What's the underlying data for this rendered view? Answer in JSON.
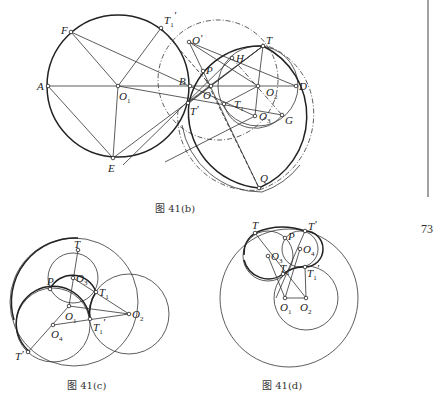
{
  "page_number": "73",
  "figures": [
    {
      "id": "fig-41b",
      "caption": "图 41(b)",
      "points": {
        "A": "A",
        "F": "F",
        "T1p": "T",
        "E": "E",
        "O1": "O",
        "B": "B",
        "Op": "O",
        "P": "P",
        "O": "O",
        "Tp": "T",
        "H": "H",
        "T": "T",
        "O2": "O",
        "D": "D",
        "T1": "T",
        "O3": "O",
        "G": "G",
        "Q": "Q"
      },
      "subscripts": {
        "T1p": "1",
        "O1": "1",
        "O2": "2",
        "T1": "1",
        "O3": "3"
      },
      "primes": {
        "T1p": "′",
        "Op": "′",
        "Tp": "′"
      }
    },
    {
      "id": "fig-41c",
      "caption": "图 41(c)",
      "points": {
        "T": "T",
        "O3": "O",
        "P": "P",
        "T1": "T",
        "O1": "O",
        "O2": "O",
        "O4": "O",
        "T1p": "T",
        "Tpp": "T"
      },
      "subscripts": {
        "O3": "3",
        "T1": "1",
        "O1": "1",
        "O2": "2",
        "O4": "4",
        "T1p": "1"
      },
      "primes": {
        "T1p": "′",
        "Tpp": "′"
      }
    },
    {
      "id": "fig-41d",
      "caption": "图 41(d)",
      "points": {
        "T": "T",
        "P": "P",
        "Tp": "T",
        "O3": "O",
        "O4": "O",
        "T1": "T",
        "T1p": "T",
        "O1": "O",
        "O2": "O"
      },
      "subscripts": {
        "O3": "3",
        "O4": "4",
        "T1": "1",
        "T1p": "1",
        "O1": "1",
        "O2": "2"
      },
      "primes": {
        "Tp": "′",
        "T1p": "′"
      }
    }
  ]
}
